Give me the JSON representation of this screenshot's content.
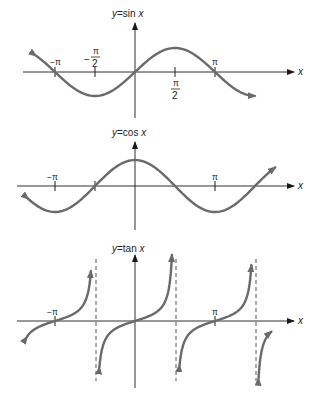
{
  "figure": {
    "curve_color": "#6a6a6a",
    "axis_color": "#1a1a1a",
    "panels": [
      {
        "id": "sin",
        "title_y": "y",
        "title_eq": "=sin ",
        "title_var": "x",
        "x_axis_label": "x",
        "tick_labels": {
          "neg_pi": "−π",
          "neg_half_pi_sign": "−",
          "half_pi_num": "π",
          "half_pi_den": "2",
          "pi": "π"
        }
      },
      {
        "id": "cos",
        "title_y": "y",
        "title_eq": "=cos ",
        "title_var": "x",
        "x_axis_label": "x",
        "tick_labels": {
          "neg_pi": "−π",
          "pi": "π"
        }
      },
      {
        "id": "tan",
        "title_y": "y",
        "title_eq": "=tan ",
        "title_var": "x",
        "x_axis_label": "x",
        "tick_labels": {
          "neg_pi": "−π",
          "pi": "π"
        }
      }
    ]
  },
  "chart_data": [
    {
      "type": "line",
      "title": "y=sin x",
      "xlabel": "x",
      "ylabel": "y",
      "x_ticks": [
        "−π",
        "−π/2",
        "π/2",
        "π"
      ],
      "x_range": [
        -3.9,
        4.7
      ],
      "series": [
        {
          "name": "sin x",
          "function": "sin",
          "amplitude": 1,
          "period": "2π",
          "x": [
            -3.9,
            -3.14,
            -1.57,
            0,
            1.57,
            3.14,
            4.71
          ],
          "y": [
            0.69,
            0,
            -1,
            0,
            1,
            0,
            -1
          ]
        }
      ],
      "grid": false
    },
    {
      "type": "line",
      "title": "y=cos x",
      "xlabel": "x",
      "ylabel": "y",
      "x_ticks": [
        "−π",
        "π"
      ],
      "x_range": [
        -4.2,
        5.5
      ],
      "series": [
        {
          "name": "cos x",
          "function": "cos",
          "amplitude": 1,
          "period": "2π",
          "x": [
            -4.2,
            -3.14,
            -1.57,
            0,
            1.57,
            3.14,
            4.71,
            5.5
          ],
          "y": [
            -0.49,
            -1,
            0,
            1,
            0,
            -1,
            0,
            0.71
          ]
        }
      ],
      "grid": false
    },
    {
      "type": "line",
      "title": "y=tan x",
      "xlabel": "x",
      "ylabel": "y",
      "x_ticks": [
        "−π",
        "π"
      ],
      "asymptotes": [
        "−π/2",
        "π/2",
        "3π/2"
      ],
      "series": [
        {
          "name": "tan x",
          "function": "tan",
          "branches": [
            {
              "x_range": [
                -4.25,
                -1.73
              ],
              "zero_at": "−π"
            },
            {
              "x_range": [
                -1.4,
                1.45
              ],
              "zero_at": "0"
            },
            {
              "x_range": [
                1.75,
                4.57
              ],
              "zero_at": "π"
            },
            {
              "x_range": [
                4.85,
                5.35
              ],
              "partial": true
            }
          ]
        }
      ],
      "grid": false
    }
  ]
}
